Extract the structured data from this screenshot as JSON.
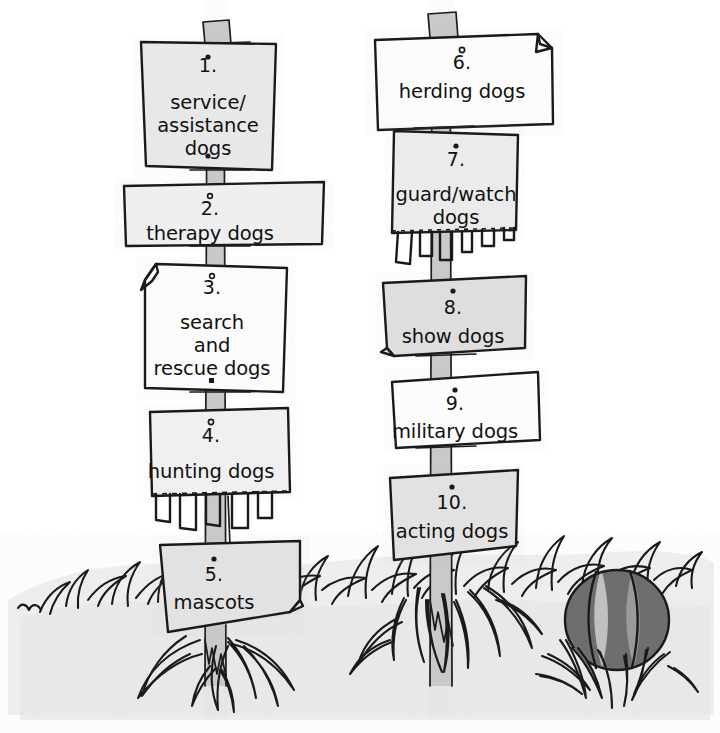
{
  "illustration": {
    "title": "Dog Categories Signpost Illustration",
    "style": "hand-drawn black ink sketch with gray washes",
    "canvas": {
      "width": 720,
      "height": 733
    },
    "background_color": "#ffffff"
  },
  "colors": {
    "ink": "#1a1a1a",
    "sign_light": "#f2f2f2",
    "sign_mid": "#e4e4e4",
    "sign_dark": "#d8d8d8",
    "post_fill": "#c9c9c9",
    "ground_wash": "#ededed",
    "ball_dark": "#6e6e6e",
    "ball_light": "#c0c0c0"
  },
  "posts": [
    {
      "id": "left-post",
      "name": "left-signpost",
      "x": 215,
      "top": 20,
      "bottom": 690
    },
    {
      "id": "right-post",
      "name": "right-signpost",
      "x": 440,
      "top": 12,
      "bottom": 690
    }
  ],
  "signs": [
    {
      "id": "sign-1",
      "number": "1.",
      "label": "service/\nassistance\ndogs",
      "lines": [
        "service/",
        "assistance",
        "dogs"
      ],
      "post": "left",
      "fill": "#e8e8e8",
      "corner_fold": "none",
      "bottom_edge": "straight",
      "box": {
        "x": 141,
        "y": 40,
        "w": 134,
        "h": 126
      }
    },
    {
      "id": "sign-2",
      "number": "2.",
      "label": "therapy dogs",
      "lines": [
        "therapy dogs"
      ],
      "post": "left",
      "fill": "#efefef",
      "corner_fold": "none",
      "bottom_edge": "straight",
      "box": {
        "x": 124,
        "y": 186,
        "w": 200,
        "h": 60
      }
    },
    {
      "id": "sign-3",
      "number": "3.",
      "label": "search\nand\nrescue dogs",
      "lines": [
        "search",
        "and",
        "rescue dogs"
      ],
      "post": "left",
      "fill": "#fbfbfb",
      "corner_fold": "top-left",
      "bottom_edge": "straight",
      "box": {
        "x": 141,
        "y": 264,
        "w": 146,
        "h": 128
      }
    },
    {
      "id": "sign-4",
      "number": "4.",
      "label": "hunting dogs",
      "lines": [
        "hunting dogs"
      ],
      "post": "left",
      "fill": "#f0f0f0",
      "corner_fold": "none",
      "bottom_edge": "torn-fringe",
      "box": {
        "x": 147,
        "y": 410,
        "w": 141,
        "h": 86
      }
    },
    {
      "id": "sign-5",
      "number": "5.",
      "label": "mascots",
      "lines": [
        "mascots"
      ],
      "post": "left",
      "fill": "#e2e2e2",
      "corner_fold": "bottom-right",
      "bottom_edge": "straight",
      "box": {
        "x": 160,
        "y": 544,
        "w": 140,
        "h": 90
      }
    },
    {
      "id": "sign-6",
      "number": "6.",
      "label": "herding dogs",
      "lines": [
        "herding dogs"
      ],
      "post": "right",
      "fill": "#fbfbfb",
      "corner_fold": "top-right",
      "bottom_edge": "straight",
      "box": {
        "x": 375,
        "y": 35,
        "w": 178,
        "h": 90
      }
    },
    {
      "id": "sign-7",
      "number": "7.",
      "label": "guard/watch\ndogs",
      "lines": [
        "guard/watch",
        "dogs"
      ],
      "post": "right",
      "fill": "#ebebeb",
      "corner_fold": "none",
      "bottom_edge": "torn-fringe",
      "box": {
        "x": 392,
        "y": 131,
        "w": 124,
        "h": 100
      }
    },
    {
      "id": "sign-8",
      "number": "8.",
      "label": "show dogs",
      "lines": [
        "show dogs"
      ],
      "post": "right",
      "fill": "#dedede",
      "corner_fold": "bottom-left",
      "bottom_edge": "straight",
      "box": {
        "x": 383,
        "y": 278,
        "w": 142,
        "h": 76
      }
    },
    {
      "id": "sign-9",
      "number": "9.",
      "label": "military dogs",
      "lines": [
        "military dogs"
      ],
      "post": "right",
      "fill": "#fcfcfc",
      "corner_fold": "none",
      "bottom_edge": "straight",
      "box": {
        "x": 392,
        "y": 378,
        "w": 146,
        "h": 66
      }
    },
    {
      "id": "sign-10",
      "number": "10.",
      "label": "acting dogs",
      "lines": [
        "acting dogs"
      ],
      "post": "right",
      "fill": "#e2e2e2",
      "corner_fold": "none",
      "bottom_edge": "straight",
      "box": {
        "x": 385,
        "y": 474,
        "w": 130,
        "h": 84
      }
    }
  ],
  "scenery": {
    "ground_label": "grass-ground",
    "ball": {
      "name": "striped-ball",
      "cx": 617,
      "cy": 620,
      "rx": 52,
      "ry": 50,
      "dark_color": "#6e6e6e",
      "light_color": "#c0c0c0",
      "stripes": 2
    }
  }
}
